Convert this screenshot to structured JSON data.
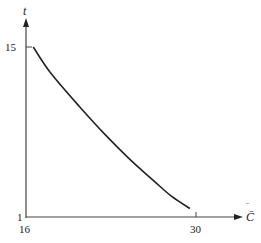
{
  "chart_data": {
    "type": "line",
    "title": "",
    "xlabel": "C̄",
    "ylabel": "t",
    "xlim": [
      16,
      30
    ],
    "ylim": [
      1,
      15
    ],
    "x_ticks": [
      "16",
      "30"
    ],
    "y_ticks": [
      "1",
      "15"
    ],
    "grid": false,
    "legend": null,
    "series": [
      {
        "name": "t vs C̄",
        "x": [
          16.6,
          18.0,
          20.4,
          22.5,
          24.6,
          26.5,
          28.0,
          29.5
        ],
        "y": [
          15.0,
          12.9,
          10.1,
          7.8,
          5.7,
          4.0,
          2.7,
          1.7
        ]
      }
    ]
  },
  "labels": {
    "y_axis": "t",
    "x_axis": "C̄",
    "y_tick_top": "15",
    "y_tick_bottom": "1",
    "x_tick_left": "16",
    "x_tick_right": "30"
  }
}
